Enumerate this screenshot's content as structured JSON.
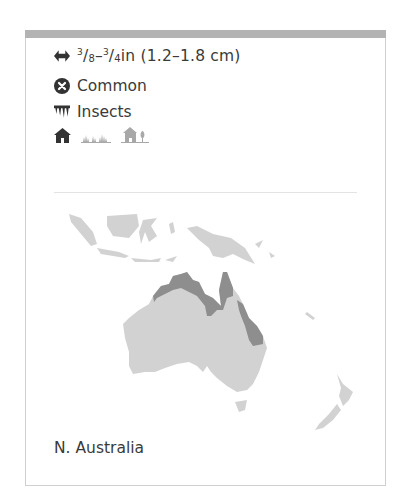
{
  "card": {
    "size": {
      "range_in_whole_from_num": "3",
      "range_in_from_den": "8",
      "dash": "–",
      "range_in_to_num": "3",
      "range_in_to_den": "4",
      "unit_in": "in",
      "metric": "(1.2–1.8 cm)",
      "icon": "double-arrow-icon"
    },
    "status": {
      "label": "Common",
      "icon": "circle-x-icon"
    },
    "diet": {
      "label": "Insects",
      "icon": "insect-prey-icon"
    },
    "habitats": [
      {
        "name": "buildings",
        "icon": "house-icon",
        "active": true
      },
      {
        "name": "grassland",
        "icon": "grass-icon",
        "active": false
      },
      {
        "name": "gardens",
        "icon": "house-tree-icon",
        "active": false
      }
    ],
    "distribution": {
      "label": "N. Australia",
      "colors": {
        "land": "#d2d2d2",
        "range": "#8e8e8e"
      }
    }
  }
}
